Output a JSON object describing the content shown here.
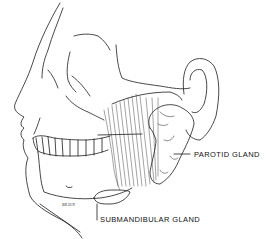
{
  "figure": {
    "labels": {
      "parotid": "PAROTID GLAND",
      "submandibular": "SUBMANDIBULAR GLAND"
    },
    "signature": "BRAUN",
    "colors": {
      "line": "#1a1a1a",
      "background": "#ffffff"
    }
  }
}
